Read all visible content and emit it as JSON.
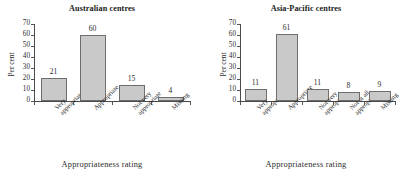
{
  "figure": {
    "background": "#ffffff",
    "bar_fill": "#c9c9c9",
    "bar_border": "#6e6e6e",
    "axis_color": "#4a4a4a",
    "text_color": "#2b2b2b"
  },
  "panels": [
    {
      "title": "Australian centres",
      "ylabel": "Per cent",
      "xlabel": "Appropriateness  rating",
      "yticks": [
        "0",
        "10",
        "20",
        "30",
        "40",
        "50",
        "60",
        "70"
      ],
      "categories": [
        {
          "line1": "Very",
          "line2": "appropriate"
        },
        {
          "line1": "Appropriate",
          "line2": ""
        },
        {
          "line1": "Not very",
          "line2": "appropriate"
        },
        {
          "line1": "Missing",
          "line2": ""
        }
      ],
      "values": [
        "21",
        "60",
        "15",
        "4"
      ]
    },
    {
      "title": "Asia-Pacific centres",
      "ylabel": "Per cent",
      "xlabel": "Appropriateness  rating",
      "yticks": [
        "0",
        "10",
        "20",
        "30",
        "40",
        "50",
        "60",
        "70"
      ],
      "categories": [
        {
          "line1": "Very",
          "line2": "appropriate"
        },
        {
          "line1": "Appropriate",
          "line2": ""
        },
        {
          "line1": "Not very",
          "line2": "appropriate"
        },
        {
          "line1": "Not at all",
          "line2": "appropriate"
        },
        {
          "line1": "Missing",
          "line2": ""
        }
      ],
      "values": [
        "11",
        "61",
        "11",
        "8",
        "9"
      ]
    }
  ],
  "chart_data": [
    {
      "type": "bar",
      "title": "Australian centres",
      "xlabel": "Appropriateness  rating",
      "ylabel": "Per cent",
      "categories": [
        "Very appropriate",
        "Appropriate",
        "Not very appropriate",
        "Missing"
      ],
      "values": [
        21,
        60,
        15,
        4
      ],
      "ylim": [
        0,
        70
      ],
      "ytick_step": 10,
      "grid": false,
      "legend": "none",
      "data_labels": true
    },
    {
      "type": "bar",
      "title": "Asia-Pacific centres",
      "xlabel": "Appropriateness  rating",
      "ylabel": "Per cent",
      "categories": [
        "Very appropriate",
        "Appropriate",
        "Not very appropriate",
        "Not at all appropriate",
        "Missing"
      ],
      "values": [
        11,
        61,
        11,
        8,
        9
      ],
      "ylim": [
        0,
        70
      ],
      "ytick_step": 10,
      "grid": false,
      "legend": "none",
      "data_labels": true
    }
  ]
}
